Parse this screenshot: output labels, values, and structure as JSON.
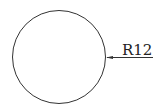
{
  "diagram": {
    "shape": "circle",
    "center": [
      59,
      57
    ],
    "radius_px": 47,
    "dimension": {
      "type": "radius",
      "label": "R12",
      "leader_start": [
        106,
        57
      ],
      "leader_end": [
        153,
        57
      ]
    },
    "colors": {
      "stroke": "#333333",
      "background": "#ffffff"
    }
  }
}
